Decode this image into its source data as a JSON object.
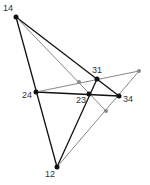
{
  "diagram": {
    "points": {
      "p14": {
        "label": "14",
        "x": 16,
        "y": 17
      },
      "p31": {
        "label": "31",
        "x": 97,
        "y": 79
      },
      "p24": {
        "label": "24",
        "x": 36,
        "y": 92
      },
      "p23": {
        "label": "23",
        "x": 89,
        "y": 94
      },
      "p34": {
        "label": "34",
        "x": 119,
        "y": 96
      },
      "p12": {
        "label": "12",
        "x": 57,
        "y": 167
      },
      "g1": {
        "x": 79,
        "y": 82
      },
      "g2": {
        "x": 139,
        "y": 71
      },
      "g3": {
        "x": 106,
        "y": 111
      }
    },
    "colors": {
      "black": "#111111",
      "gray": "#888888"
    }
  }
}
